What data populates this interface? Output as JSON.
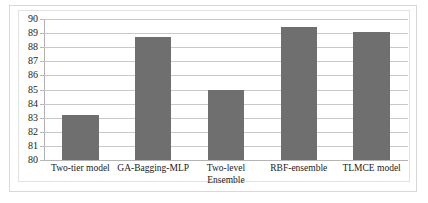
{
  "chart_data": {
    "type": "bar",
    "title": "",
    "subtitle": "",
    "xlabel": "",
    "ylabel": "",
    "categories": [
      "Two-tier model",
      "GA-Bagging-MLP",
      "Two-level\nEnsemble",
      "RBF-ensemble",
      "TLMCE model"
    ],
    "values": [
      83.2,
      88.75,
      85.0,
      89.4,
      89.05
    ],
    "ylim": [
      80,
      90
    ],
    "ytick_labels": [
      "90",
      "89",
      "88",
      "87",
      "86",
      "85",
      "84",
      "83",
      "82",
      "81",
      "80"
    ],
    "ytick_values": [
      90,
      89,
      88,
      87,
      86,
      85,
      84,
      83,
      82,
      81,
      80
    ],
    "grid": true,
    "legend": false,
    "legend_position": "none",
    "bar_color": "#6f6f6f",
    "gridline_color": "#c9c9c9",
    "axis_color": "#b0b0b0",
    "background_color": "#ffffff"
  }
}
